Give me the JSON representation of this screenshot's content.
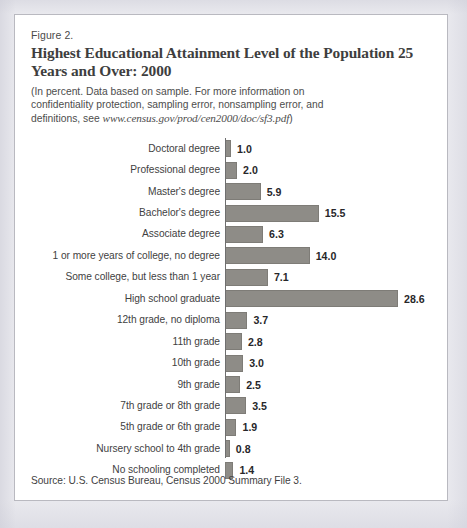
{
  "figure": {
    "number": "Figure 2.",
    "title": "Highest Educational Attainment Level of the Population 25 Years and Over:  2000",
    "note_text": "(In percent.  Data based on sample.  For more information on confidentiality protection, sampling error, nonsampling error, and definitions, see ",
    "note_url": "www.census.gov/prod/cen2000/doc/sf3.pdf",
    "note_close": ")",
    "source": "Source:  U.S. Census Bureau, Census 2000 Summary File 3."
  },
  "colors": {
    "bar_fill": "#8e8c87",
    "bar_stroke": "#7e7c77",
    "axis": "#6f6f6f",
    "title_text": "#3e3e3e",
    "body_text": "#3f3f3f",
    "page_background": "#e9e9ee",
    "figure_background": "#ffffff",
    "figure_border": "#b9b9c0"
  },
  "chart_data": {
    "type": "bar",
    "orientation": "horizontal",
    "title": "Highest Educational Attainment Level of the Population 25 Years and Over:  2000",
    "subtitle": "Figure 2.",
    "xlabel": "",
    "ylabel": "",
    "unit": "percent",
    "xlim": [
      0,
      30
    ],
    "grid": false,
    "legend": "none",
    "value_label_format": "one-decimal",
    "source": "Source:  U.S. Census Bureau, Census 2000 Summary File 3.",
    "categories": [
      "Doctoral degree",
      "Professional degree",
      "Master's degree",
      "Bachelor's degree",
      "Associate degree",
      "1 or more years of college, no degree",
      "Some college, but less than 1 year",
      "High school graduate",
      "12th grade, no diploma",
      "11th grade",
      "10th grade",
      "9th grade",
      "7th grade or 8th grade",
      "5th grade or 6th grade",
      "Nursery school to 4th grade",
      "No schooling completed"
    ],
    "values": [
      1.0,
      2.0,
      5.9,
      15.5,
      6.3,
      14.0,
      7.1,
      28.6,
      3.7,
      2.8,
      3.0,
      2.5,
      3.5,
      1.9,
      0.8,
      1.4
    ],
    "value_labels": [
      "1.0",
      "2.0",
      "5.9",
      "15.5",
      "6.3",
      "14.0",
      "7.1",
      "28.6",
      "3.7",
      "2.8",
      "3.0",
      "2.5",
      "3.5",
      "1.9",
      "0.8",
      "1.4"
    ]
  }
}
